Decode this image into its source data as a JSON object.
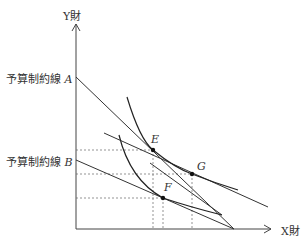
{
  "diagram": {
    "type": "indifference-curve / budget-constraint",
    "axes": {
      "y_label": "Y財",
      "x_label": "X財"
    },
    "budget_lines": [
      {
        "label": "予算制約線",
        "point": "A"
      },
      {
        "label": "予算制約線",
        "point": "B"
      }
    ],
    "points": [
      "E",
      "G",
      "F"
    ],
    "colors": {
      "line": "#333333",
      "dash": "#555555"
    }
  }
}
